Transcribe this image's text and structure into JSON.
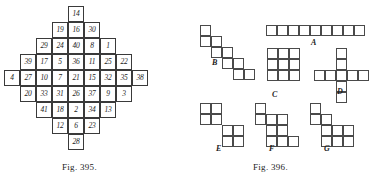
{
  "figures": {
    "left": {
      "caption": "Fig. 395.",
      "type": "number-grid-diamond",
      "cell_size": 16,
      "origin": {
        "x": 4,
        "y": 6
      },
      "rows": [
        {
          "row": 0,
          "start_col": 4,
          "values": [
            14
          ]
        },
        {
          "row": 1,
          "start_col": 3,
          "values": [
            19,
            16,
            30
          ]
        },
        {
          "row": 2,
          "start_col": 2,
          "values": [
            29,
            24,
            40,
            8,
            1
          ]
        },
        {
          "row": 3,
          "start_col": 1,
          "values": [
            39,
            17,
            5,
            36,
            11,
            25,
            22
          ]
        },
        {
          "row": 4,
          "start_col": 0,
          "values": [
            4,
            27,
            10,
            7,
            21,
            15,
            32,
            35,
            38
          ]
        },
        {
          "row": 5,
          "start_col": 1,
          "values": [
            20,
            33,
            31,
            26,
            37,
            9,
            3
          ]
        },
        {
          "row": 6,
          "start_col": 2,
          "values": [
            41,
            18,
            2,
            34,
            13
          ]
        },
        {
          "row": 7,
          "start_col": 3,
          "values": [
            12,
            6,
            23
          ]
        },
        {
          "row": 8,
          "start_col": 4,
          "values": [
            28
          ]
        }
      ]
    },
    "right": {
      "caption": "Fig. 396.",
      "type": "polyomino-pieces",
      "cell_size": 11,
      "shapes": [
        {
          "id": "A",
          "label": "A",
          "origin": {
            "x": 77,
            "y": 25
          },
          "label_pos": {
            "x": 122,
            "y": 38
          },
          "cells": [
            [
              0,
              0
            ],
            [
              1,
              0
            ],
            [
              2,
              0
            ],
            [
              3,
              0
            ],
            [
              4,
              0
            ],
            [
              5,
              0
            ],
            [
              6,
              0
            ],
            [
              7,
              0
            ],
            [
              8,
              0
            ]
          ]
        },
        {
          "id": "B",
          "label": "B",
          "origin": {
            "x": 11,
            "y": 25
          },
          "label_pos": {
            "x": 23,
            "y": 58
          },
          "cells": [
            [
              0,
              0
            ],
            [
              0,
              1
            ],
            [
              1,
              1
            ],
            [
              1,
              2
            ],
            [
              2,
              2
            ],
            [
              2,
              3
            ],
            [
              3,
              3
            ],
            [
              3,
              4
            ],
            [
              4,
              4
            ]
          ]
        },
        {
          "id": "C",
          "label": "C",
          "origin": {
            "x": 78,
            "y": 48
          },
          "label_pos": {
            "x": 83,
            "y": 90
          },
          "cells": [
            [
              0,
              0
            ],
            [
              1,
              0
            ],
            [
              2,
              0
            ],
            [
              0,
              1
            ],
            [
              1,
              1
            ],
            [
              2,
              1
            ],
            [
              0,
              2
            ],
            [
              1,
              2
            ],
            [
              2,
              2
            ]
          ]
        },
        {
          "id": "D",
          "label": "D",
          "origin": {
            "x": 125,
            "y": 48
          },
          "label_pos": {
            "x": 148,
            "y": 87
          },
          "cells": [
            [
              2,
              0
            ],
            [
              2,
              1
            ],
            [
              0,
              2
            ],
            [
              1,
              2
            ],
            [
              2,
              2
            ],
            [
              3,
              2
            ],
            [
              4,
              2
            ],
            [
              2,
              3
            ],
            [
              2,
              4
            ]
          ]
        },
        {
          "id": "E",
          "label": "E",
          "origin": {
            "x": 11,
            "y": 103
          },
          "label_pos": {
            "x": 27,
            "y": 144
          },
          "cells": [
            [
              0,
              0
            ],
            [
              1,
              0
            ],
            [
              0,
              1
            ],
            [
              1,
              1
            ],
            [
              2,
              2
            ],
            [
              3,
              2
            ],
            [
              2,
              3
            ],
            [
              3,
              3
            ]
          ]
        },
        {
          "id": "F",
          "label": "F",
          "origin": {
            "x": 66,
            "y": 103
          },
          "label_pos": {
            "x": 80,
            "y": 144
          },
          "cells": [
            [
              0,
              0
            ],
            [
              0,
              1
            ],
            [
              1,
              1
            ],
            [
              2,
              1
            ],
            [
              1,
              2
            ],
            [
              2,
              2
            ],
            [
              1,
              3
            ],
            [
              2,
              3
            ],
            [
              3,
              3
            ]
          ]
        },
        {
          "id": "G",
          "label": "G",
          "origin": {
            "x": 121,
            "y": 103
          },
          "label_pos": {
            "x": 135,
            "y": 144
          },
          "cells": [
            [
              0,
              0
            ],
            [
              0,
              1
            ],
            [
              1,
              1
            ],
            [
              1,
              2
            ],
            [
              2,
              2
            ],
            [
              3,
              2
            ],
            [
              1,
              3
            ],
            [
              2,
              3
            ],
            [
              3,
              3
            ]
          ]
        }
      ]
    }
  },
  "captions": {
    "left_pos": {
      "x": 62,
      "y": 162
    },
    "right_pos": {
      "x": 253,
      "y": 162
    }
  },
  "colors": {
    "page_background": "#ffffff",
    "cell_stroke": "#3a3a3a",
    "block_stroke": "#4a4a4a",
    "text": "#1c1c1c"
  }
}
